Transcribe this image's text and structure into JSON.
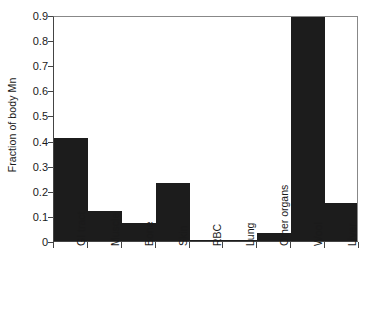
{
  "chart_data": {
    "type": "bar",
    "title": "",
    "subtitle": "",
    "xlabel": "",
    "ylabel": "Fraction of body Mn",
    "categories": [
      "GI tract",
      "Muscle",
      "Bone",
      "Skin",
      "RBC",
      "Lung",
      "Other organs",
      "Wool",
      "Liver"
    ],
    "values": [
      0.41,
      0.12,
      0.07,
      0.23,
      0.003,
      0.002,
      0.03,
      0.9,
      0.15
    ],
    "ylim": [
      0,
      0.9
    ],
    "xlim": [
      0,
      9
    ],
    "ytick_labels": [
      "0",
      "0.1",
      "0.2",
      "0.3",
      "0.4",
      "0.5",
      "0.6",
      "0.7",
      "0.8",
      "0.9"
    ],
    "ytick_values": [
      0,
      0.1,
      0.2,
      0.3,
      0.4,
      0.5,
      0.6,
      0.7,
      0.8,
      0.9
    ],
    "grid": false,
    "legend": null,
    "legend_position": "none",
    "bar_color": "#1c1c1c",
    "axis_color": "#444444",
    "frame_color": "#888888",
    "background": "#ffffff",
    "annotations": []
  },
  "axis": {
    "y_title": "Fraction of body Mn"
  }
}
